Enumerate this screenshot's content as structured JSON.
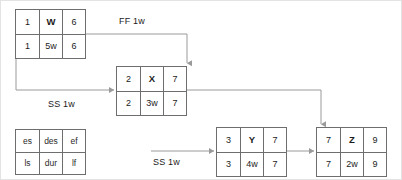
{
  "diagram": {
    "type": "precedence-network-diagram",
    "line_color": "#9a9a9a",
    "box_border_color": "#6e6e6e",
    "text_color": "#1b1b1b",
    "background": "#ffffff",
    "legend": {
      "name": "key-box",
      "top": [
        "es",
        "des",
        "ef"
      ],
      "bottom": [
        "ls",
        "dur",
        "lf"
      ]
    },
    "nodes": [
      {
        "id": "W",
        "es": "1",
        "name": "W",
        "ef": "6",
        "ls": "1",
        "dur": "5w",
        "lf": "6"
      },
      {
        "id": "X",
        "es": "2",
        "name": "X",
        "ef": "7",
        "ls": "2",
        "dur": "3w",
        "lf": "7"
      },
      {
        "id": "Y",
        "es": "3",
        "name": "Y",
        "ef": "7",
        "ls": "3",
        "dur": "4w",
        "lf": "7"
      },
      {
        "id": "Z",
        "es": "7",
        "name": "Z",
        "ef": "9",
        "ls": "7",
        "dur": "2w",
        "lf": "9"
      }
    ],
    "links": [
      {
        "from": "W",
        "to": "X",
        "label": "FF 1w",
        "relation": "finish-to-finish",
        "lag": "1w"
      },
      {
        "from": "W",
        "to": "X",
        "label": "SS 1w",
        "relation": "start-to-start",
        "lag": "1w"
      },
      {
        "from": "Y",
        "to": "Z",
        "label": "SS 1w",
        "relation": "start-to-start",
        "lag": "1w"
      },
      {
        "from": "X",
        "to": "Z",
        "label": "",
        "relation": "finish-to-start",
        "lag": ""
      }
    ]
  }
}
